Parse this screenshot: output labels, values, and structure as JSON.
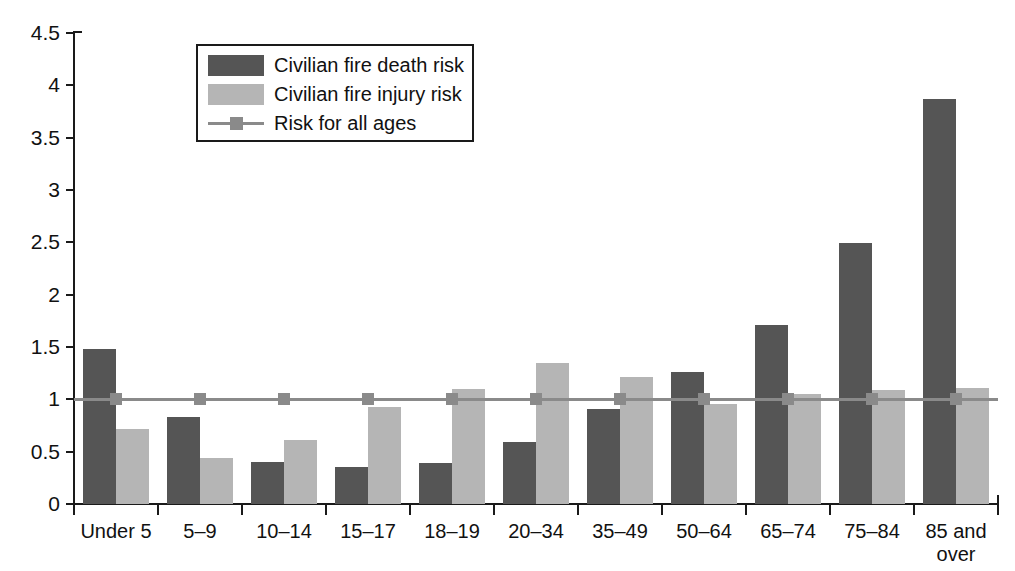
{
  "chart_data": {
    "type": "bar",
    "title": "",
    "xlabel": "",
    "ylabel": "",
    "ylim": [
      0,
      4.5
    ],
    "ytick_labels": [
      "0",
      "0.5",
      "1",
      "1.5",
      "2",
      "2.5",
      "3",
      "3.5",
      "4",
      "4.5"
    ],
    "ytick_values": [
      0,
      0.5,
      1,
      1.5,
      2,
      2.5,
      3,
      3.5,
      4,
      4.5
    ],
    "grid": false,
    "legend_position": "top-left-inside",
    "categories": [
      "Under 5",
      "5–9",
      "10–14",
      "15–17",
      "18–19",
      "20–34",
      "35–49",
      "50–64",
      "65–74",
      "75–84",
      "85 and over"
    ],
    "series": [
      {
        "name": "Civilian fire death risk",
        "type": "bar",
        "color": "#555555",
        "values": [
          1.48,
          0.83,
          0.4,
          0.35,
          0.39,
          0.59,
          0.91,
          1.26,
          1.71,
          2.49,
          3.87
        ]
      },
      {
        "name": "Civilian fire injury risk",
        "type": "bar",
        "color": "#b5b5b5",
        "values": [
          0.72,
          0.44,
          0.61,
          0.93,
          1.1,
          1.35,
          1.21,
          0.96,
          1.05,
          1.09,
          1.11
        ]
      },
      {
        "name": "Risk for all ages",
        "type": "line",
        "color": "#8a8a8a",
        "marker": "square",
        "values": [
          1.0,
          1.0,
          1.0,
          1.0,
          1.0,
          1.0,
          1.0,
          1.0,
          1.0,
          1.0,
          1.0
        ]
      }
    ],
    "legend": [
      {
        "label": "Civilian fire death risk",
        "swatch": "dark"
      },
      {
        "label": "Civilian fire injury risk",
        "swatch": "light"
      },
      {
        "label": "Risk for all ages",
        "swatch": "line"
      }
    ]
  }
}
